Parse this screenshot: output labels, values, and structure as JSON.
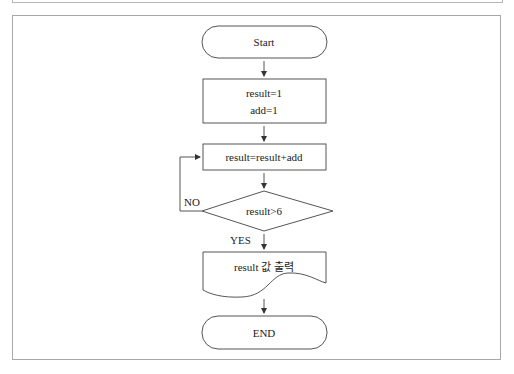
{
  "flowchart": {
    "nodes": {
      "start": {
        "type": "terminator",
        "label": "Start"
      },
      "init": {
        "type": "process",
        "lines": [
          "result=1",
          "add=1"
        ]
      },
      "accumulate": {
        "type": "process",
        "label": "result=result+add"
      },
      "decision": {
        "type": "decision",
        "label": "result>6"
      },
      "output": {
        "type": "document",
        "label": "result 값 출력"
      },
      "end": {
        "type": "terminator",
        "label": "END"
      }
    },
    "edges": {
      "no_label": "NO",
      "yes_label": "YES"
    },
    "colors": {
      "stroke": "#555555",
      "frame": "#a8a8a8",
      "text": "#222222"
    }
  }
}
